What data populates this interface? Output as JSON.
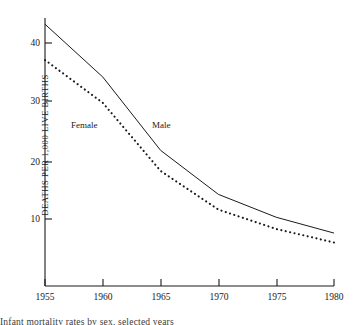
{
  "chart_data": {
    "type": "line",
    "title": "",
    "subtitle": "",
    "xlabel": "",
    "ylabel": "DEATHS PER 1,000 LIVE BIRTHS",
    "x": [
      1955,
      1960,
      1965,
      1970,
      1975,
      1980
    ],
    "xlim": [
      1955,
      1980
    ],
    "ylim": [
      0,
      45
    ],
    "xticks": [
      1955,
      1960,
      1965,
      1970,
      1975,
      1980
    ],
    "xtick_labels": [
      "1955",
      "1960",
      "1965",
      "1970",
      "1975",
      "1980"
    ],
    "yticks": [
      10,
      20,
      30,
      40
    ],
    "ytick_labels": [
      "10",
      "20",
      "30",
      "40"
    ],
    "grid": false,
    "legend_position": "inline-annotations",
    "series": [
      {
        "name": "Male",
        "style": "solid",
        "color": "#1a1a1a",
        "label_x": 1966.5,
        "label_y": 26.5,
        "values": [
          43.2,
          34.2,
          21.7,
          14.2,
          10.3,
          7.6
        ]
      },
      {
        "name": "Female",
        "style": "dotted",
        "color": "#1a1a1a",
        "label_x": 1959.2,
        "label_y": 26.5,
        "values": [
          37.1,
          29.8,
          18.2,
          11.6,
          8.3,
          6.0
        ]
      }
    ],
    "annotations": [
      {
        "text": "Female",
        "x": 1959.2,
        "y": 26.5
      },
      {
        "text": "Male",
        "x": 1966.5,
        "y": 26.5
      }
    ]
  },
  "axis": {
    "y_title": "DEATHS PER 1,000 LIVE BIRTHS",
    "ytick_0": "10",
    "ytick_1": "20",
    "ytick_2": "30",
    "ytick_3": "40",
    "xtick_0": "1955",
    "xtick_1": "1960",
    "xtick_2": "1965",
    "xtick_3": "1970",
    "xtick_4": "1975",
    "xtick_5": "1980"
  },
  "labels": {
    "female": "Female",
    "male": "Male"
  },
  "caption": {
    "clipped_line": "Infant mortality rates by sex, selected years"
  },
  "colors": {
    "ink": "#1a1a1a",
    "background": "#ffffff"
  }
}
